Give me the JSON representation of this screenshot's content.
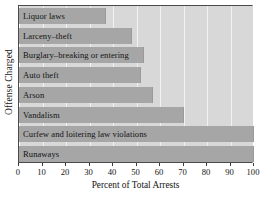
{
  "chart_data": {
    "type": "bar",
    "orientation": "horizontal",
    "title": "",
    "xlabel": "Percent of Total Arrests",
    "ylabel": "Offense Charged",
    "categories": [
      "Liquor laws",
      "Larceny–theft",
      "Burglary–breaking or entering",
      "Auto theft",
      "Arson",
      "Vandalism",
      "Curfew and loitering law violations",
      "Runaways"
    ],
    "values": [
      37,
      48,
      53,
      52,
      57,
      70,
      100,
      100
    ],
    "xlim": [
      0,
      100
    ],
    "xticks": [
      0,
      10,
      20,
      30,
      40,
      50,
      60,
      70,
      80,
      90,
      100
    ],
    "xtick_labels": [
      "0",
      "10",
      "20",
      "30",
      "40",
      "50",
      "60",
      "70",
      "80",
      "90",
      "100"
    ],
    "grid": "vertical",
    "legend": "none",
    "bar_color": "#a6a6a6",
    "plot_background": "#d8d8d8",
    "gridline_color": "#f2f2f2",
    "axis_color": "#4a4a4a"
  }
}
